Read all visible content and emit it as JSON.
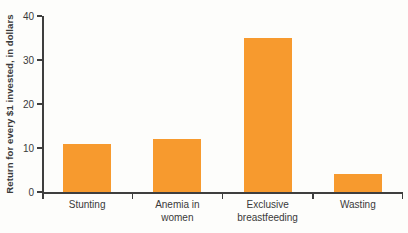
{
  "chart_data": {
    "type": "bar",
    "categories": [
      "Stunting",
      "Anemia in women",
      "Exclusive breastfeeding",
      "Wasting"
    ],
    "values": [
      11,
      12,
      35,
      4
    ],
    "title": "",
    "xlabel": "",
    "ylabel": "Return for every $1 invested, in dollars",
    "ylim": [
      0,
      40
    ],
    "yticks": [
      0,
      10,
      20,
      30,
      40
    ],
    "grid": false,
    "legend": "none",
    "bar_color": "#F79A2E",
    "axis_color": "#3E3E3E",
    "text_color": "#3A3A3A",
    "background_color": "#FDFDFB"
  }
}
